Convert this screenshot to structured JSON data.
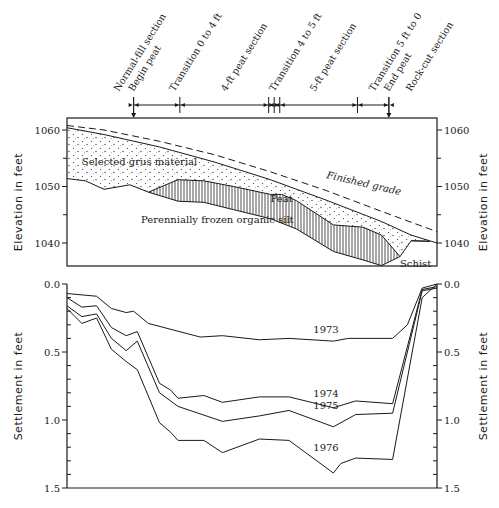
{
  "chart_data": [
    {
      "type": "area",
      "title": "Profile cross-section",
      "xlabel": "",
      "ylabel": "Elevation in feet",
      "ylabel_right": "Elevation in feet",
      "ylim": [
        1034,
        1062
      ],
      "yticks": [
        1040,
        1050,
        1060
      ],
      "yticks_minor": [
        1045,
        1055
      ],
      "x_units": "percent of profile length",
      "xlim": [
        0,
        100
      ],
      "sections": [
        {
          "label": "Normal-fill section",
          "x": 14
        },
        {
          "label": "Begin peat",
          "x": 18,
          "arrow": true
        },
        {
          "label": "Transition 0 to 4 ft",
          "x": 29
        },
        {
          "label": "4-ft peat section",
          "x": 43
        },
        {
          "label": "Transition 4 to 5 ft",
          "x": 56
        },
        {
          "label": "5-ft peat section",
          "x": 67
        },
        {
          "label": "Transition 5 ft to 0",
          "x": 83
        },
        {
          "label": "End peat",
          "x": 87,
          "arrow": true
        },
        {
          "label": "Rock-cut section",
          "x": 93
        }
      ],
      "boundaries": [
        18,
        30.5,
        54.5,
        56,
        57.5,
        78.5,
        87
      ],
      "series": [
        {
          "name": "Finished grade",
          "style": "dashed",
          "x": [
            0,
            10,
            25,
            40,
            55,
            70,
            85,
            100
          ],
          "y": [
            1060.8,
            1060.0,
            1058.0,
            1055.6,
            1052.6,
            1049.3,
            1045.6,
            1042.0
          ]
        },
        {
          "name": "Embankment surface",
          "style": "solid",
          "x": [
            0,
            10,
            25,
            40,
            55,
            70,
            85,
            93,
            100
          ],
          "y": [
            1060.4,
            1059.2,
            1057.0,
            1054.3,
            1051.2,
            1047.6,
            1043.8,
            1041.4,
            1040.0
          ]
        },
        {
          "name": "Base of grus / top of peat",
          "style": "solid",
          "x": [
            0,
            5,
            10,
            17,
            22,
            30,
            37,
            45,
            55,
            58,
            62,
            72,
            80,
            85,
            90,
            93,
            98
          ],
          "y": [
            1051.4,
            1051.0,
            1049.5,
            1050.3,
            1049.0,
            1051.2,
            1051.0,
            1050.0,
            1048.6,
            1048.6,
            1047.5,
            1043.2,
            1042.8,
            1041.4,
            1037.6,
            1040.4,
            1040.3
          ]
        },
        {
          "name": "Base of peat",
          "style": "solid",
          "x": [
            22,
            30,
            37,
            45,
            55,
            62,
            72,
            80,
            85,
            90
          ],
          "y": [
            1049.0,
            1047.4,
            1047.2,
            1045.9,
            1044.3,
            1042.5,
            1038.5,
            1037.0,
            1036.0,
            1037.6
          ]
        }
      ],
      "annotations": [
        {
          "text": "Selected grus material",
          "x": 4,
          "y": 1053.8
        },
        {
          "text": "Finished grade",
          "x": 70,
          "y": 1051.5
        },
        {
          "text": "Peat",
          "x": 55,
          "y": 1047.2
        },
        {
          "text": "Perennially frozen organic silt",
          "x": 20,
          "y": 1043.6
        },
        {
          "text": "Schist",
          "x": 90,
          "y": 1035.8
        }
      ]
    },
    {
      "type": "line",
      "title": "Settlement",
      "xlabel": "",
      "ylabel": "Settlement in feet",
      "ylabel_right": "Settlement in feet",
      "ylim": [
        0,
        1.5
      ],
      "y_inverted": true,
      "yticks": [
        "0.0",
        "0.5",
        "1.0",
        "1.5"
      ],
      "yticks_minor": [
        0.1,
        0.2,
        0.3,
        0.4,
        0.6,
        0.7,
        0.8,
        0.9,
        1.1,
        1.2,
        1.3,
        1.4
      ],
      "x_units": "percent of profile length",
      "xlim": [
        0,
        100
      ],
      "series": [
        {
          "name": "1973",
          "x": [
            0,
            8,
            12,
            16,
            18,
            22,
            36,
            42,
            52,
            60,
            72,
            76,
            88,
            92,
            96,
            100
          ],
          "y": [
            0.07,
            0.09,
            0.18,
            0.21,
            0.2,
            0.29,
            0.39,
            0.38,
            0.41,
            0.4,
            0.42,
            0.4,
            0.4,
            0.3,
            0.03,
            0.0
          ]
        },
        {
          "name": "1974",
          "x": [
            0,
            4,
            8,
            12,
            16,
            19,
            25,
            28,
            30,
            37,
            42,
            52,
            60,
            72,
            78,
            88,
            96,
            100
          ],
          "y": [
            0.1,
            0.17,
            0.16,
            0.32,
            0.38,
            0.35,
            0.73,
            0.78,
            0.84,
            0.82,
            0.87,
            0.83,
            0.83,
            0.91,
            0.86,
            0.88,
            0.04,
            0.02
          ]
        },
        {
          "name": "1975",
          "x": [
            0,
            4,
            8,
            12,
            16,
            19,
            25,
            30,
            42,
            52,
            60,
            72,
            78,
            88,
            96,
            100
          ],
          "y": [
            0.16,
            0.24,
            0.22,
            0.4,
            0.49,
            0.42,
            0.8,
            0.9,
            1.01,
            0.97,
            0.93,
            1.05,
            0.96,
            0.95,
            0.05,
            0.03
          ]
        },
        {
          "name": "1976",
          "x": [
            0,
            4,
            8,
            12,
            16,
            19,
            25,
            28,
            30,
            37,
            42,
            52,
            60,
            72,
            74,
            78,
            88,
            96,
            100
          ],
          "y": [
            0.18,
            0.29,
            0.25,
            0.48,
            0.57,
            0.63,
            1.02,
            1.09,
            1.15,
            1.15,
            1.24,
            1.14,
            1.15,
            1.39,
            1.32,
            1.28,
            1.29,
            0.1,
            0.0
          ]
        }
      ],
      "series_labels": [
        {
          "text": "1973",
          "x": 70,
          "y": 0.36
        },
        {
          "text": "1974",
          "x": 70,
          "y": 0.83
        },
        {
          "text": "1975",
          "x": 70,
          "y": 0.92
        },
        {
          "text": "1976",
          "x": 70,
          "y": 1.23
        }
      ]
    }
  ]
}
